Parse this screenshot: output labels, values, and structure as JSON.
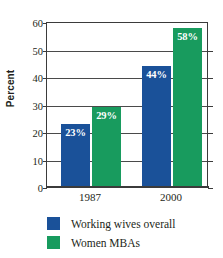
{
  "chart_data": {
    "type": "bar",
    "title": "",
    "xlabel": "",
    "ylabel": "Percent",
    "categories": [
      "1987",
      "2000"
    ],
    "series": [
      {
        "name": "Working wives overall",
        "color": "#1a5199",
        "values": [
          23,
          44
        ],
        "labels": [
          "23%",
          "44%"
        ]
      },
      {
        "name": "Women MBAs",
        "color": "#189b5e",
        "values": [
          29,
          58
        ],
        "labels": [
          "29%",
          "58%"
        ]
      }
    ],
    "ylim": [
      0,
      60
    ],
    "yticks": [
      0,
      10,
      20,
      30,
      40,
      50,
      60
    ],
    "ytick_labels": [
      "0",
      "10",
      "20",
      "30",
      "40",
      "50",
      "60"
    ],
    "grid": true,
    "grid_axis": "y",
    "legend_position": "bottom-left",
    "background_color": "#ffffff",
    "axis_color": "#3b3b3b",
    "text_color": "#231f20",
    "data_label_color": "#ffffff"
  },
  "legend": {
    "entries": [
      {
        "label": "Working wives overall",
        "color": "#1a5199"
      },
      {
        "label": "Women MBAs",
        "color": "#189b5e"
      }
    ]
  }
}
